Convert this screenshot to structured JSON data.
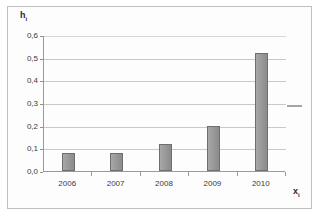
{
  "chart_data": {
    "type": "bar",
    "title": "",
    "xlabel": "x",
    "xlabel_sub": "i",
    "ylabel": "h",
    "ylabel_sub": "i",
    "categories": [
      "2006",
      "2007",
      "2008",
      "2009",
      "2010"
    ],
    "values": [
      0.08,
      0.08,
      0.12,
      0.2,
      0.52
    ],
    "ylim": [
      0.0,
      0.6
    ],
    "ytick_values": [
      0.0,
      0.1,
      0.2,
      0.3,
      0.4,
      0.5,
      0.6
    ],
    "ytick_labels": [
      "0,0",
      "0,1",
      "0,2",
      "0,3",
      "0,4",
      "0,5",
      "0,6"
    ],
    "grid": true,
    "legend": "none",
    "bar_color": "#969696",
    "bar_border_color": "#6e6e6e",
    "gridline_color": "#c9c9c9",
    "axis_color": "#9a9a9a",
    "background_color": "#ffffff"
  }
}
